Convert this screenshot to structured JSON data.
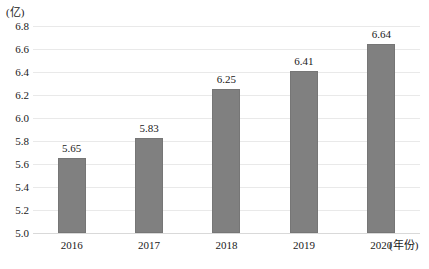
{
  "chart_data": {
    "type": "bar",
    "title": "",
    "subtitle": "",
    "categories": [
      "2016",
      "2017",
      "2018",
      "2019",
      "2020"
    ],
    "values": [
      5.65,
      5.83,
      6.25,
      6.41,
      6.64
    ],
    "value_labels": [
      "5.65",
      "5.83",
      "6.25",
      "6.41",
      "6.64"
    ],
    "xlabel": "(年份)",
    "ylabel": "(亿)",
    "ylim": [
      5.0,
      6.8
    ],
    "ytick_step": 0.2,
    "yticks": [
      "6.8",
      "6.6",
      "6.4",
      "6.2",
      "6.0",
      "5.8",
      "5.6",
      "5.4",
      "5.2",
      "5.0"
    ],
    "ytick_values": [
      6.8,
      6.6,
      6.4,
      6.2,
      6.0,
      5.8,
      5.6,
      5.4,
      5.2,
      5.0
    ],
    "grid": true,
    "legend": false,
    "legend_position": "none",
    "series": [
      {
        "name": "",
        "values": [
          5.65,
          5.83,
          6.25,
          6.41,
          6.64
        ]
      }
    ],
    "colors": {
      "bar_fill": "#808080",
      "bar_border": "#767676",
      "gridline": "#e9e9e9",
      "baseline": "#d9d9d9",
      "text": "#1a1a1a",
      "background": "#ffffff"
    }
  }
}
